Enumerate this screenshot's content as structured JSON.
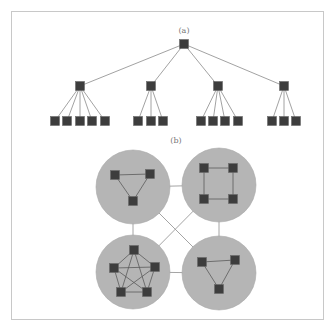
{
  "figure": {
    "panel_a": {
      "label": "(a)",
      "type": "tree",
      "root": {
        "x": 184,
        "y": 44
      },
      "level1": [
        {
          "x": 80,
          "y": 86,
          "children": [
            55,
            67,
            80,
            92,
            105
          ]
        },
        {
          "x": 151,
          "y": 86,
          "children": [
            138,
            151,
            163
          ]
        },
        {
          "x": 218,
          "y": 86,
          "children": [
            201,
            213,
            225,
            238
          ]
        },
        {
          "x": 284,
          "y": 86,
          "children": [
            272,
            284,
            296
          ]
        }
      ],
      "leaf_y": 121
    },
    "panel_b": {
      "label": "(b)",
      "type": "clustered-graph",
      "clusters": [
        {
          "name": "triangle-cluster-top-left",
          "cx": 133,
          "cy": 187,
          "r": 37,
          "nodes": [
            [
              115,
              175
            ],
            [
              150,
              174
            ],
            [
              133,
              201
            ]
          ],
          "edges": [
            [
              0,
              1
            ],
            [
              1,
              2
            ],
            [
              2,
              0
            ]
          ]
        },
        {
          "name": "square-cluster-top-right",
          "cx": 219,
          "cy": 185,
          "r": 37,
          "nodes": [
            [
              204,
              168
            ],
            [
              233,
              168
            ],
            [
              233,
              199
            ],
            [
              204,
              199
            ]
          ],
          "edges": [
            [
              0,
              1
            ],
            [
              1,
              2
            ],
            [
              2,
              3
            ],
            [
              3,
              0
            ]
          ]
        },
        {
          "name": "pentagon-cluster-bottom-left",
          "cx": 133,
          "cy": 272,
          "r": 37,
          "nodes": [
            [
              134,
              250
            ],
            [
              155,
              267
            ],
            [
              147,
              292
            ],
            [
              121,
              292
            ],
            [
              114,
              268
            ]
          ],
          "edges": [
            [
              0,
              1
            ],
            [
              0,
              2
            ],
            [
              0,
              3
            ],
            [
              0,
              4
            ],
            [
              1,
              2
            ],
            [
              1,
              3
            ],
            [
              1,
              4
            ],
            [
              2,
              3
            ],
            [
              2,
              4
            ],
            [
              3,
              4
            ]
          ]
        },
        {
          "name": "triangle-cluster-bottom-right",
          "cx": 219,
          "cy": 273,
          "r": 37,
          "nodes": [
            [
              202,
              262
            ],
            [
              235,
              260
            ],
            [
              219,
              289
            ]
          ],
          "edges": [
            [
              0,
              1
            ],
            [
              1,
              2
            ],
            [
              2,
              0
            ]
          ]
        }
      ],
      "links": [
        [
          0,
          1
        ],
        [
          2,
          3
        ],
        [
          0,
          2
        ],
        [
          1,
          3
        ],
        [
          0,
          3
        ],
        [
          1,
          2
        ]
      ]
    }
  },
  "colors": {
    "node": "#3d3d3d",
    "cluster_fill": "#b5b5b5",
    "edge": "#8a8a8a",
    "frame": "#c8c8c8"
  }
}
